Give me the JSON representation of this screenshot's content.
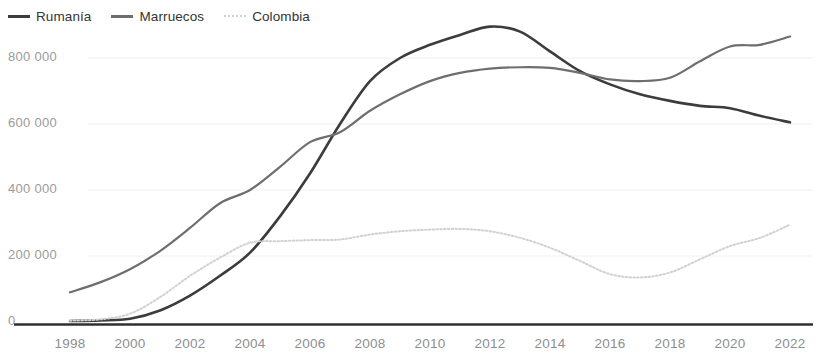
{
  "legend": {
    "position": "top-left",
    "items": [
      {
        "label": "Rumanía",
        "color": "#3c3c3c",
        "style": "solid"
      },
      {
        "label": "Marruecos",
        "color": "#6e6e6e",
        "style": "solid"
      },
      {
        "label": "Colombia",
        "color": "#d2d2d2",
        "style": "dotted"
      }
    ]
  },
  "axes": {
    "y_ticks": [
      "0",
      "200 000",
      "400 000",
      "600 000",
      "800 000"
    ],
    "x_ticks": [
      "1998",
      "2000",
      "2002",
      "2004",
      "2006",
      "2008",
      "2010",
      "2012",
      "2014",
      "2016",
      "2018",
      "2020",
      "2022"
    ]
  },
  "chart_data": {
    "type": "line",
    "title": "",
    "subtitle": "",
    "xlabel": "",
    "ylabel": "",
    "xlim": [
      1998,
      2022
    ],
    "ylim": [
      0,
      900000
    ],
    "grid": false,
    "legend_position": "top-left",
    "ytick_values": [
      0,
      200000,
      400000,
      600000,
      800000
    ],
    "ytick_labels": [
      "0",
      "200 000",
      "400 000",
      "600 000",
      "800 000"
    ],
    "xtick_values": [
      1998,
      2000,
      2002,
      2004,
      2006,
      2008,
      2010,
      2012,
      2014,
      2016,
      2018,
      2020,
      2022
    ],
    "xtick_labels": [
      "1998",
      "2000",
      "2002",
      "2004",
      "2006",
      "2008",
      "2010",
      "2012",
      "2014",
      "2016",
      "2018",
      "2020",
      "2022"
    ],
    "x": [
      1998,
      1999,
      2000,
      2001,
      2002,
      2003,
      2004,
      2005,
      2006,
      2007,
      2008,
      2009,
      2010,
      2011,
      2012,
      2013,
      2014,
      2015,
      2016,
      2017,
      2018,
      2019,
      2020,
      2021,
      2022
    ],
    "series": [
      {
        "name": "Rumanía",
        "color": "#3c3c3c",
        "style": "solid",
        "values": [
          3000,
          5000,
          10000,
          35000,
          80000,
          140000,
          210000,
          320000,
          450000,
          600000,
          730000,
          800000,
          840000,
          870000,
          895000,
          880000,
          820000,
          760000,
          720000,
          690000,
          670000,
          655000,
          648000,
          625000,
          605000
        ]
      },
      {
        "name": "Marruecos",
        "color": "#6e6e6e",
        "style": "solid",
        "values": [
          90000,
          120000,
          160000,
          215000,
          285000,
          360000,
          400000,
          470000,
          545000,
          575000,
          640000,
          690000,
          730000,
          755000,
          768000,
          772000,
          770000,
          755000,
          735000,
          730000,
          740000,
          790000,
          835000,
          840000,
          865000
        ]
      },
      {
        "name": "Colombia",
        "color": "#d2d2d2",
        "style": "dotted",
        "values": [
          4000,
          8000,
          25000,
          75000,
          140000,
          195000,
          240000,
          245000,
          248000,
          250000,
          265000,
          275000,
          280000,
          282000,
          275000,
          255000,
          225000,
          185000,
          145000,
          135000,
          150000,
          190000,
          230000,
          255000,
          295000
        ]
      }
    ]
  }
}
